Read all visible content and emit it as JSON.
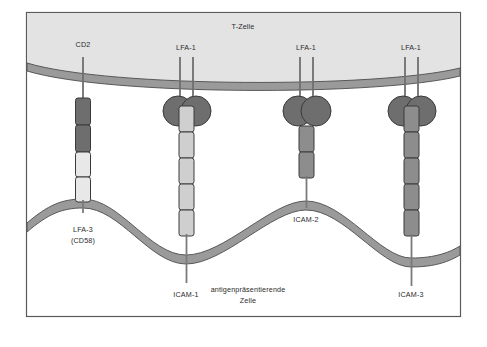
{
  "figure": {
    "title_cell_top": "T-Zelle",
    "title_cell_bottom_line1": "antigenpräsentierende",
    "title_cell_bottom_line2": "Zelle",
    "frame_border_color": "#5a5a5a",
    "background_color": "#ffffff"
  },
  "colors": {
    "t_cell_fill": "#e3e3e3",
    "apc_fill": "#ffffff",
    "membrane_fill": "#9a9a9a",
    "membrane_stroke": "#4d4d4d",
    "domain_dark": "#6e6e6e",
    "domain_medium": "#8d8d8d",
    "domain_light": "#cfcfcf",
    "domain_pale": "#e8e8e8",
    "stalk": "#7a7a7a",
    "outline": "#3a3a3a"
  },
  "t_cell_receptors": [
    {
      "name": "CD2",
      "label": "CD2",
      "x": 83,
      "type": "stalk",
      "domains": 2,
      "domain_color": "domain_dark"
    },
    {
      "name": "LFA-1a",
      "label": "LFA-1",
      "x": 186,
      "type": "integrin"
    },
    {
      "name": "LFA-1b",
      "label": "LFA-1",
      "x": 306,
      "type": "integrin"
    },
    {
      "name": "LFA-1c",
      "label": "LFA-1",
      "x": 411,
      "type": "integrin"
    }
  ],
  "apc_ligands": [
    {
      "name": "LFA-3",
      "label_line1": "LFA-3",
      "label_line2": "(CD58)",
      "x": 83,
      "domains": 2,
      "domain_color": "domain_pale"
    },
    {
      "name": "ICAM-1",
      "label_line1": "ICAM-1",
      "label_line2": "",
      "x": 186,
      "domains": 5,
      "domain_color": "domain_light"
    },
    {
      "name": "ICAM-2",
      "label_line1": "ICAM-2",
      "label_line2": "",
      "x": 306,
      "domains": 2,
      "domain_color": "domain_medium"
    },
    {
      "name": "ICAM-3",
      "label_line1": "ICAM-3",
      "label_line2": "",
      "x": 411,
      "domains": 5,
      "domain_color": "domain_medium"
    }
  ],
  "labels": {
    "cd2": "CD2",
    "lfa1_left": "LFA-1",
    "lfa1_mid": "LFA-1",
    "lfa1_right": "LFA-1",
    "t_zelle": "T-Zelle",
    "lfa3": "LFA-3",
    "cd58": "(CD58)",
    "icam1": "ICAM-1",
    "icam2": "ICAM-2",
    "icam3": "ICAM-3",
    "apc_line1": "antigenpräsentierende",
    "apc_line2": "Zelle"
  }
}
